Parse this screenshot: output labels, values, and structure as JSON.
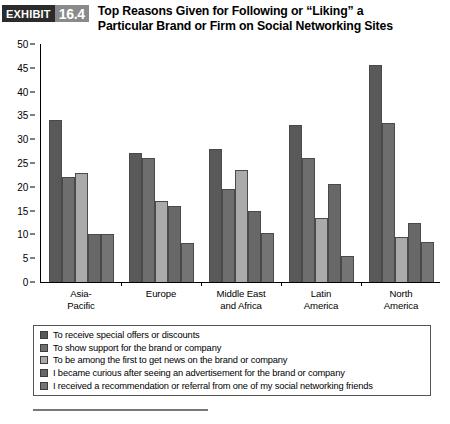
{
  "header": {
    "exhibit_word": "EXHIBIT",
    "exhibit_number": "16.4",
    "title_line1": "Top Reasons Given for Following or “Liking” a",
    "title_line2": "Particular Brand or Firm on Social Networking Sites"
  },
  "chart_data": {
    "type": "bar",
    "title": "Top Reasons Given for Following or “Liking” a Particular Brand or Firm on Social Networking Sites",
    "xlabel": "",
    "ylabel": "",
    "ylim": [
      0,
      50
    ],
    "yticks": [
      0,
      5,
      10,
      15,
      20,
      25,
      30,
      35,
      40,
      45,
      50
    ],
    "grid": false,
    "legend_position": "bottom",
    "categories": [
      "Asia-\nPacific",
      "Europe",
      "Middle East\nand Africa",
      "Latin\nAmerica",
      "North\nAmerica"
    ],
    "category_labels": [
      {
        "line1": "Asia-",
        "line2": "Pacific"
      },
      {
        "line1": "Europe",
        "line2": ""
      },
      {
        "line1": "Middle East",
        "line2": "and Africa"
      },
      {
        "line1": "Latin",
        "line2": "America"
      },
      {
        "line1": "North",
        "line2": "America"
      }
    ],
    "series": [
      {
        "name": "To receive special offers or discounts",
        "color": "#595959",
        "values": [
          34,
          27,
          28,
          33,
          45.5
        ]
      },
      {
        "name": "To show support for the brand or company",
        "color": "#6e6e6e",
        "values": [
          22,
          26,
          19.5,
          26,
          33.5
        ]
      },
      {
        "name": "To be among the first to get news on the brand or company",
        "color": "#aaaaaa",
        "values": [
          23,
          17,
          23.5,
          13.5,
          9.5
        ]
      },
      {
        "name": "I became curious after seeing an advertisement for the brand or company",
        "color": "#686868",
        "values": [
          10,
          16,
          15,
          20.5,
          12.5
        ]
      },
      {
        "name": "I received a recommendation or referral from one of my social networking friends",
        "color": "#747474",
        "values": [
          10,
          8.2,
          10.2,
          5.4,
          8.5
        ]
      }
    ]
  },
  "legend": {
    "items": [
      {
        "label": "To receive special offers or discounts",
        "color": "#595959"
      },
      {
        "label": "To show support for the brand or company",
        "color": "#6e6e6e"
      },
      {
        "label": "To be among the first to get news on the brand or company",
        "color": "#aaaaaa"
      },
      {
        "label": "I became curious after seeing an advertisement for the brand or company",
        "color": "#686868"
      },
      {
        "label": "I received a recommendation or referral from one of my social networking friends",
        "color": "#747474"
      }
    ]
  }
}
